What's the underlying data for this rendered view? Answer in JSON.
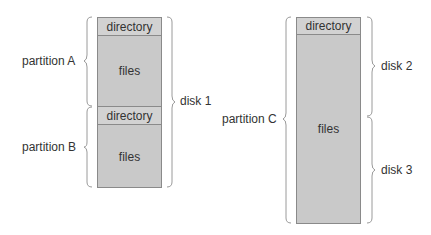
{
  "left_disk_group": {
    "blocks": [
      {
        "label": "directory"
      },
      {
        "label": "files"
      },
      {
        "label": "directory"
      },
      {
        "label": "files"
      }
    ],
    "partition_a_label": "partition A",
    "partition_b_label": "partition B",
    "disk_label": "disk 1"
  },
  "right_disk_group": {
    "blocks": [
      {
        "label": "directory"
      },
      {
        "label": "files"
      }
    ],
    "partition_label": "partition C",
    "disk_top_label": "disk 2",
    "disk_bottom_label": "disk 3"
  }
}
